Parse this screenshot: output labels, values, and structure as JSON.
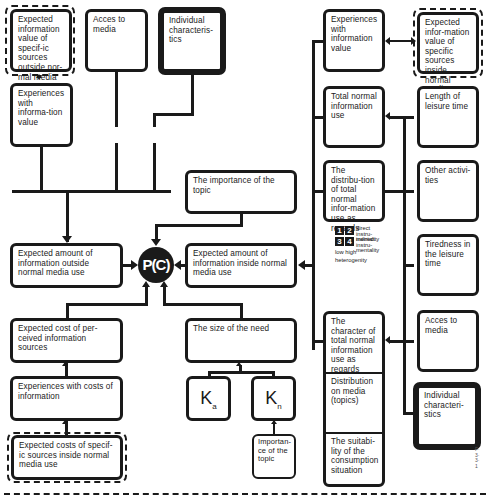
{
  "diagram": {
    "center_node": {
      "label": "P(C)"
    },
    "left_column": {
      "expected_info_value_outside": "Expected information value of specif-ic sources outside nor-mal media use",
      "experiences_info_value": "Experiences with informa-tion value",
      "acces_to_media": "Acces to media",
      "individual_characteristics": "Individual characteris-tics",
      "expected_amount_outside": "Expected amount of information outside normal media use",
      "expected_cost_perceived": "Expected cost of per-ceived information sources",
      "experiences_costs": "Experiences with costs of information",
      "expected_costs_inside": "Expected costs of specif-ic sources inside normal media use"
    },
    "middle_column": {
      "importance_of_topic": "The importance of the topic",
      "expected_amount_inside": "Expected amount of information inside normal media use",
      "size_of_need": "The size of the need",
      "ka": {
        "main": "K",
        "sub": "a"
      },
      "kn": {
        "main": "K",
        "sub": "n"
      },
      "importance_small": "Importan-ce of the topic"
    },
    "right_column": {
      "experiences_info_value": "Experiences with information value",
      "total_normal_info_use": "Total normal information use",
      "distribution_total": "The distribu-tion of total normal infor-mation use as regards",
      "character_total": "The character of total normal information use as regards",
      "distribution_media": "Distribution on media (topics)",
      "suitability": "The suitabi-lity of the consumption situation"
    },
    "far_right_column": {
      "expected_info_value_inside": "Expected infor-mation value of specific sources inside normal media use",
      "length_leisure": "Length of leisure time",
      "other_activities": "Other activi-ties",
      "tiredness": "Tiredness in the leisure time",
      "acces_to_media": "Acces to media",
      "individual_characteristics": "Individual characteri-stics"
    },
    "legend": {
      "squares": [
        "1",
        "2",
        "3",
        "4"
      ],
      "row1_label": "direct instru-mentality",
      "row2_label": "indirect instru-mentality",
      "axis_label": "low high",
      "axis_caption": "heterogenity"
    },
    "side_note": "F·3·3·1"
  }
}
